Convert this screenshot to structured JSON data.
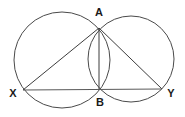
{
  "figure": {
    "background_color": "#ffffff",
    "stroke_color": "#4a4a4a",
    "label_color": "#1a1a1a",
    "width": 185,
    "height": 117
  },
  "labels": {
    "apex": "A",
    "intersection_lower": "B",
    "left_vertex": "X",
    "right_vertex": "Y"
  },
  "chart_data": {
    "type": "diagram",
    "circles": [
      {
        "name": "left-circle",
        "cx": 62,
        "cy": 60,
        "r": 48
      },
      {
        "name": "right-circle",
        "cx": 131,
        "cy": 59,
        "r": 43
      }
    ],
    "points": [
      {
        "label": "A",
        "x": 99,
        "y": 28,
        "label_x": 99,
        "label_y": 13
      },
      {
        "label": "B",
        "x": 99,
        "y": 90,
        "label_x": 100,
        "label_y": 103
      },
      {
        "label": "X",
        "x": 23,
        "y": 90,
        "label_x": 13,
        "label_y": 94
      },
      {
        "label": "Y",
        "x": 162,
        "y": 89,
        "label_x": 171,
        "label_y": 94
      }
    ],
    "segments": [
      {
        "name": "XA",
        "from": "X",
        "to": "A",
        "x1": 23,
        "y1": 90,
        "x2": 99,
        "y2": 28
      },
      {
        "name": "AY",
        "from": "A",
        "to": "Y",
        "x1": 99,
        "y1": 28,
        "x2": 162,
        "y2": 89
      },
      {
        "name": "XY",
        "from": "X",
        "to": "Y",
        "x1": 23,
        "y1": 90,
        "x2": 162,
        "y2": 89
      },
      {
        "name": "AB",
        "from": "A",
        "to": "B",
        "x1": 99,
        "y1": 28,
        "x2": 99,
        "y2": 90
      }
    ]
  }
}
